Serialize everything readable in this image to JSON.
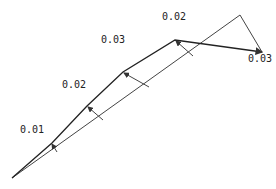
{
  "diagram": {
    "type": "deflection-profile",
    "baseline": {
      "from": [
        12,
        178
      ],
      "to": [
        240,
        15
      ]
    },
    "closing_segment": {
      "from": [
        240,
        15
      ],
      "to": [
        262,
        52
      ]
    },
    "curve_points": [
      [
        12,
        178
      ],
      [
        52,
        143
      ],
      [
        87,
        106
      ],
      [
        123,
        72
      ],
      [
        175,
        40
      ],
      [
        262,
        52
      ]
    ],
    "stations": [
      {
        "label": "0.01",
        "curve_point": [
          52,
          143
        ],
        "base_point": [
          57,
          152
        ],
        "label_pos": [
          20,
          125
        ]
      },
      {
        "label": "0.02",
        "curve_point": [
          87,
          106
        ],
        "base_point": [
          103,
          120
        ],
        "label_pos": [
          62,
          84
        ]
      },
      {
        "label": "0.03",
        "curve_point": [
          123,
          72
        ],
        "base_point": [
          149,
          87
        ],
        "label_pos": [
          101,
          37
        ]
      },
      {
        "label": "0.02",
        "curve_point": [
          175,
          40
        ],
        "base_point": [
          193,
          56
        ],
        "label_pos": [
          162,
          14
        ]
      },
      {
        "label": "0.03",
        "curve_point": [
          262,
          52
        ],
        "base_point": null,
        "label_pos": [
          248,
          55
        ]
      }
    ],
    "colors": {
      "line": "#333333",
      "text": "#222222",
      "background": "#ffffff"
    }
  }
}
